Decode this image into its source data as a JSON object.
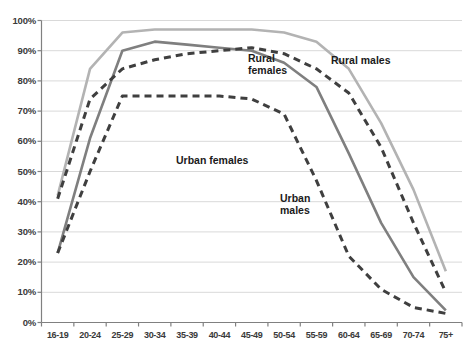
{
  "chart_data": {
    "type": "line",
    "title": "",
    "xlabel": "",
    "ylabel": "",
    "ylim": [
      0,
      100
    ],
    "ytick_labels": [
      "0%",
      "10%",
      "20%",
      "30%",
      "40%",
      "50%",
      "60%",
      "70%",
      "80%",
      "90%",
      "100%"
    ],
    "ytick_values": [
      0,
      10,
      20,
      30,
      40,
      50,
      60,
      70,
      80,
      90,
      100
    ],
    "grid": "horizontal",
    "legend_position": "inline-annotations",
    "categories": [
      "16-19",
      "20-24",
      "25-29",
      "30-34",
      "35-39",
      "40-44",
      "45-49",
      "50-54",
      "55-59",
      "60-64",
      "65-69",
      "70-74",
      "75+"
    ],
    "series": [
      {
        "name": "Rural males",
        "values": [
          42,
          84,
          96,
          97,
          97,
          97,
          97,
          96,
          93,
          84,
          66,
          44,
          17
        ],
        "color": "#b3b3b3",
        "style": "solid",
        "width": 2.6
      },
      {
        "name": "Rural females",
        "values": [
          23,
          61,
          90,
          93,
          92,
          91,
          90,
          86,
          78,
          56,
          33,
          15,
          4
        ],
        "color": "#7f7f7f",
        "style": "solid",
        "width": 2.6
      },
      {
        "name": "Urban females",
        "values": [
          41,
          74,
          84,
          87,
          89,
          90,
          91,
          89,
          84,
          76,
          58,
          33,
          10
        ],
        "color": "#3f3f3f",
        "style": "dashed",
        "width": 3.0
      },
      {
        "name": "Urban males",
        "values": [
          23,
          50,
          75,
          75,
          75,
          75,
          74,
          69,
          47,
          22,
          11,
          5,
          3
        ],
        "color": "#3f3f3f",
        "style": "dashed",
        "width": 3.0
      }
    ],
    "annotations": [
      {
        "text": "Rural\nfemales",
        "series": "Rural females",
        "x_px": 248,
        "y_px": 52
      },
      {
        "text": "Rural males",
        "series": "Rural males",
        "x_px": 331,
        "y_px": 54
      },
      {
        "text": "Urban females",
        "series": "Urban females",
        "x_px": 176,
        "y_px": 154
      },
      {
        "text": "Urban\nmales",
        "series": "Urban males",
        "x_px": 280,
        "y_px": 192
      }
    ]
  },
  "axes": {
    "axis_color": "#808080",
    "grid_color": "#d9d9d9",
    "tick_color": "#808080",
    "background": "#ffffff"
  }
}
